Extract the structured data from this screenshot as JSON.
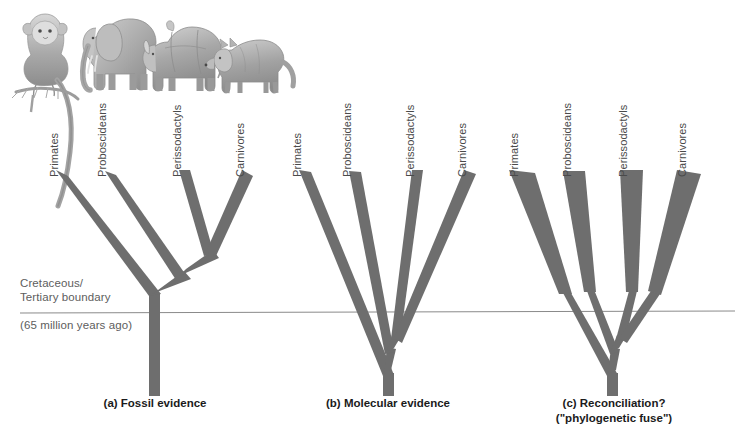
{
  "figure": {
    "background_color": "#ffffff",
    "branch_color": "#6e6e6e",
    "boundary_line_color": "#8a8a8a",
    "text_color": "#4a4a4a",
    "caption_color": "#1b1b1b"
  },
  "boundary": {
    "label_line1": "Cretaceous/",
    "label_line2": "Tertiary boundary",
    "age_label": "(65 million years ago)",
    "y_pixel": 312,
    "line_start_x": 20,
    "line_end_x": 735
  },
  "taxa": [
    {
      "name": "Primates",
      "icon": "monkey-illustration"
    },
    {
      "name": "Proboscideans",
      "icon": "elephant-illustration"
    },
    {
      "name": "Perissodactyls",
      "icon": "rhinoceros-illustration"
    },
    {
      "name": "Carnivores",
      "icon": "wolf-illustration"
    }
  ],
  "panels": [
    {
      "id": "fossil",
      "caption_line1": "(a) Fossil evidence",
      "caption_line2": "",
      "caption_x": 155,
      "caption_y": 396,
      "tips": [
        62,
        110,
        185,
        248
      ],
      "label_x": [
        58,
        106,
        181,
        244
      ],
      "root_x": 154,
      "root_bottom": 396,
      "divergence_note": "All divergences occur above the K/T boundary"
    },
    {
      "id": "molecular",
      "caption_line1": "(b) Molecular evidence",
      "caption_line2": "",
      "caption_x": 388,
      "caption_y": 396,
      "tips": [
        305,
        355,
        418,
        470
      ],
      "label_x": [
        301,
        351,
        414,
        466
      ],
      "root_x": 388,
      "root_bottom": 396,
      "divergence_note": "All divergences occur below the K/T boundary"
    },
    {
      "id": "reconciliation",
      "caption_line1": "(c) Reconciliation?",
      "caption_line2": "(\"phylogenetic fuse\")",
      "caption_x": 614,
      "caption_y": 390,
      "tips": [
        522,
        575,
        631,
        690
      ],
      "label_x": [
        518,
        571,
        627,
        686
      ],
      "root_x": 612,
      "root_bottom": 396,
      "fuse_top_y": 290,
      "divergence_note": "Lineages diverge below the boundary as thin 'fuses', radiating above it"
    }
  ],
  "animals": {
    "caption": "Pencil illustrations of a tamarin monkey, an African elephant, a rhinoceros, and a wolf",
    "items": [
      {
        "name": "monkey-illustration",
        "x": 20,
        "y": 10
      },
      {
        "name": "elephant-illustration",
        "x": 80,
        "y": 12
      },
      {
        "name": "rhinoceros-illustration",
        "x": 150,
        "y": 20
      },
      {
        "name": "wolf-illustration",
        "x": 210,
        "y": 28
      }
    ]
  }
}
